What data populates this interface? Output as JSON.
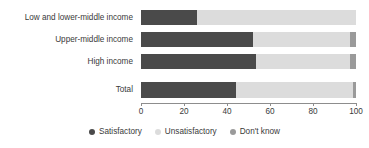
{
  "chart_data": {
    "type": "bar",
    "orientation": "horizontal",
    "stacked": true,
    "title": "",
    "subtitle": "",
    "xlabel": "",
    "ylabel": "",
    "xlim": [
      0,
      100
    ],
    "xticks": [
      0,
      20,
      40,
      60,
      80,
      100
    ],
    "xtick_labels": [
      "0",
      "20",
      "40",
      "60",
      "80",
      "100"
    ],
    "grid": false,
    "legend_position": "bottom",
    "categories": [
      "Low and lower-middle income",
      "Upper-middle income",
      "High income",
      "Total"
    ],
    "series": [
      {
        "name": "Satisfactory",
        "color": "#4a4a4a",
        "values": [
          26,
          52,
          53.5,
          44
        ]
      },
      {
        "name": "Unsatisfactory",
        "color": "#dcdcdc",
        "values": [
          74,
          45,
          43.5,
          54.5
        ]
      },
      {
        "name": "Don't know",
        "color": "#9a9a9a",
        "values": [
          0,
          3,
          3,
          1.5
        ]
      }
    ]
  },
  "colors": {
    "satisfactory": "#4a4a4a",
    "unsatisfactory": "#dcdcdc",
    "dont_know": "#9a9a9a",
    "axis": "#8d8d8d",
    "text": "#3a3a3a",
    "background": "#ffffff"
  },
  "legend": {
    "items": [
      {
        "label": "Satisfactory",
        "icon": "circle-swatch-icon"
      },
      {
        "label": "Unsatisfactory",
        "icon": "circle-swatch-icon"
      },
      {
        "label": "Don't know",
        "icon": "circle-swatch-icon"
      }
    ]
  }
}
